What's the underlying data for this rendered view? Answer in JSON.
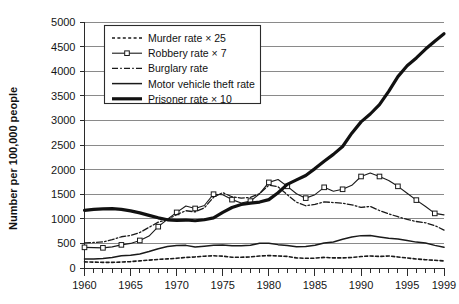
{
  "chart_data": {
    "type": "line",
    "title": "",
    "xlabel": "",
    "ylabel": "Number per 100,000 people",
    "xlim": [
      1960,
      1999
    ],
    "ylim": [
      0,
      5000
    ],
    "ytick_step": 500,
    "yticks": [
      "0",
      "500",
      "1000",
      "1500",
      "2000",
      "2500",
      "3000",
      "3500",
      "4000",
      "4500",
      "5000"
    ],
    "xticks": [
      "1960",
      "1965",
      "1970",
      "1975",
      "1980",
      "1985",
      "1990",
      "1995",
      "1999"
    ],
    "xtick_minor_step": 1,
    "grid": "horizontal",
    "legend_position": "top-left-inside",
    "x": [
      1960,
      1961,
      1962,
      1963,
      1964,
      1965,
      1966,
      1967,
      1968,
      1969,
      1970,
      1971,
      1972,
      1973,
      1974,
      1975,
      1976,
      1977,
      1978,
      1979,
      1980,
      1981,
      1982,
      1983,
      1984,
      1985,
      1986,
      1987,
      1988,
      1989,
      1990,
      1991,
      1992,
      1993,
      1994,
      1995,
      1996,
      1997,
      1998,
      1999
    ],
    "series": [
      {
        "name": "Murder rate × 25",
        "style": "dotted",
        "marker": "none",
        "width": 1.6,
        "color": "#1a1a1a",
        "values": [
          125,
          120,
          115,
          115,
          120,
          130,
          145,
          160,
          175,
          185,
          197,
          215,
          225,
          240,
          248,
          240,
          220,
          218,
          225,
          243,
          252,
          245,
          235,
          205,
          197,
          200,
          215,
          205,
          205,
          215,
          233,
          245,
          235,
          245,
          225,
          203,
          183,
          168,
          158,
          143
        ]
      },
      {
        "name": "Robbery rate × 7",
        "style": "solid-marker",
        "marker": "square",
        "width": 1.1,
        "color": "#1a1a1a",
        "values": [
          420,
          415,
          410,
          430,
          470,
          500,
          560,
          650,
          840,
          990,
          1130,
          1260,
          1210,
          1270,
          1500,
          1490,
          1390,
          1320,
          1360,
          1510,
          1740,
          1800,
          1660,
          1510,
          1420,
          1490,
          1640,
          1560,
          1600,
          1680,
          1860,
          1930,
          1860,
          1780,
          1660,
          1520,
          1380,
          1250,
          1110,
          1080
        ]
      },
      {
        "name": "Burglary rate",
        "style": "dashdot",
        "marker": "none",
        "width": 1.3,
        "color": "#1a1a1a",
        "values": [
          509,
          519,
          530,
          576,
          635,
          663,
          721,
          827,
          932,
          984,
          1085,
          1164,
          1141,
          1223,
          1438,
          1532,
          1448,
          1420,
          1435,
          1512,
          1684,
          1650,
          1489,
          1338,
          1265,
          1292,
          1345,
          1330,
          1316,
          1284,
          1232,
          1252,
          1168,
          1100,
          1042,
          987,
          945,
          919,
          863,
          770
        ]
      },
      {
        "name": "Motor vehicle theft rate",
        "style": "solid",
        "marker": "none",
        "width": 1.5,
        "color": "#1a1a1a",
        "values": [
          183,
          184,
          195,
          212,
          247,
          257,
          286,
          334,
          393,
          436,
          457,
          460,
          426,
          443,
          462,
          469,
          450,
          452,
          461,
          505,
          502,
          475,
          459,
          431,
          437,
          463,
          508,
          529,
          583,
          631,
          658,
          659,
          632,
          606,
          591,
          560,
          526,
          506,
          460,
          422
        ]
      },
      {
        "name": "Prisoner rate × 10",
        "style": "solid-thick",
        "marker": "none",
        "width": 3.2,
        "color": "#111111",
        "values": [
          1170,
          1190,
          1200,
          1205,
          1190,
          1160,
          1120,
          1070,
          1020,
          980,
          970,
          975,
          960,
          980,
          1020,
          1130,
          1230,
          1290,
          1320,
          1340,
          1390,
          1530,
          1700,
          1790,
          1880,
          2020,
          2170,
          2310,
          2470,
          2740,
          2970,
          3130,
          3320,
          3590,
          3890,
          4110,
          4270,
          4450,
          4610,
          4760
        ]
      }
    ]
  },
  "legend": {
    "entries": [
      "Murder rate × 25",
      "Robbery rate × 7",
      "Burglary rate",
      "Motor vehicle theft rate",
      "Prisoner rate × 10"
    ]
  }
}
